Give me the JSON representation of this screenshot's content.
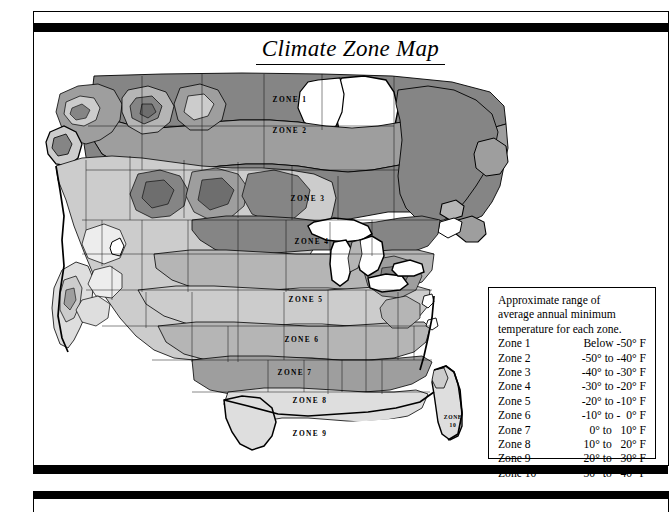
{
  "title": "Climate Zone Map",
  "map": {
    "zone_labels": [
      {
        "id": "zone-1",
        "text": "ZONE 1",
        "x": 248,
        "y": 32
      },
      {
        "id": "zone-2",
        "text": "ZONE 2",
        "x": 248,
        "y": 63
      },
      {
        "id": "zone-3",
        "text": "ZONE 3",
        "x": 266,
        "y": 131
      },
      {
        "id": "zone-4",
        "text": "ZONE 4",
        "x": 270,
        "y": 174
      },
      {
        "id": "zone-5",
        "text": "ZONE 5",
        "x": 264,
        "y": 232
      },
      {
        "id": "zone-6",
        "text": "ZONE 6",
        "x": 260,
        "y": 272
      },
      {
        "id": "zone-7",
        "text": "ZONE 7",
        "x": 253,
        "y": 305
      },
      {
        "id": "zone-8",
        "text": "ZONE 8",
        "x": 268,
        "y": 333
      },
      {
        "id": "zone-9",
        "text": "ZONE 9",
        "x": 268,
        "y": 366
      }
    ],
    "zone10_label": {
      "line1": "ZONE",
      "line2": "10",
      "x": 421,
      "y": 352
    }
  },
  "legend": {
    "heading_line1": "Approximate range of",
    "heading_line2": "average annual minimum",
    "heading_line3": "temperature for each zone.",
    "rows": [
      {
        "zone": "Zone 1",
        "range": "Below -50° F"
      },
      {
        "zone": "Zone 2",
        "range": "-50° to -40° F"
      },
      {
        "zone": "Zone 3",
        "range": "-40° to -30° F"
      },
      {
        "zone": "Zone 4",
        "range": "-30° to -20° F"
      },
      {
        "zone": "Zone 5",
        "range": "-20° to -10° F"
      },
      {
        "zone": "Zone 6",
        "range": "-10° to -  0° F"
      },
      {
        "zone": "Zone 7",
        "range": "  0° to   10° F"
      },
      {
        "zone": "Zone 8",
        "range": " 10° to   20° F"
      },
      {
        "zone": "Zone 9",
        "range": " 20° to   30° F"
      },
      {
        "zone": "Zone 10",
        "range": " 30° to   40° F"
      }
    ]
  },
  "colors": {
    "ink": "#000000",
    "water": "#ffffff",
    "tone_darkest": "#6e6e6e",
    "tone_dark": "#858585",
    "tone_mid": "#9e9e9e",
    "tone_midlight": "#b5b5b5",
    "tone_light": "#cccccc",
    "tone_lightest": "#dedede",
    "tone_pale": "#ededed"
  }
}
